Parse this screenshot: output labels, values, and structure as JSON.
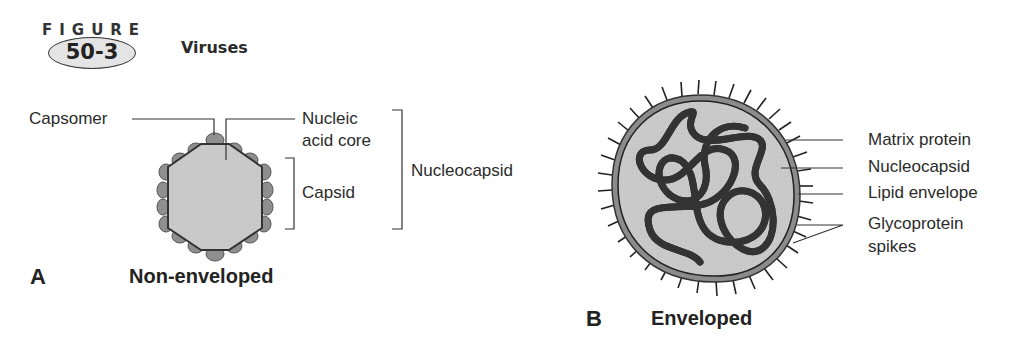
{
  "header": {
    "figure_word": "FIGURE",
    "figure_number": "50-3",
    "title": "Viruses"
  },
  "panel_a": {
    "letter": "A",
    "title": "Non-enveloped",
    "labels": {
      "capsomer": "Capsomer",
      "nucleic_acid_core_line1": "Nucleic",
      "nucleic_acid_core_line2": "acid core",
      "capsid": "Capsid",
      "nucleocapsid": "Nucleocapsid"
    }
  },
  "panel_b": {
    "letter": "B",
    "title": "Enveloped",
    "labels": {
      "matrix_protein": "Matrix protein",
      "nucleocapsid": "Nucleocapsid",
      "lipid_envelope": "Lipid envelope",
      "glycoprotein_line1": "Glycoprotein",
      "glycoprotein_line2": "spikes"
    }
  },
  "colors": {
    "fill_light": "#c8c8c8",
    "capsomer_fill": "#8f8f8f",
    "outline": "#333333",
    "strand": "#ffffff"
  }
}
